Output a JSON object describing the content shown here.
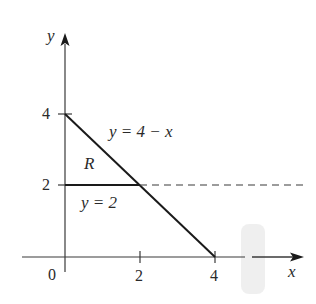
{
  "figure": {
    "title": "",
    "axes": {
      "x_label": "x",
      "y_label": "y",
      "origin_label": "0",
      "x_ticks": [
        {
          "value": 2,
          "label": "2"
        },
        {
          "value": 4,
          "label": "4"
        }
      ],
      "y_ticks": [
        {
          "value": 2,
          "label": "2"
        },
        {
          "value": 4,
          "label": "4"
        }
      ],
      "x_range": [
        0,
        5.3
      ],
      "y_range": [
        0,
        6
      ]
    },
    "curves": [
      {
        "name": "line-y-equals-4-minus-x",
        "equation": "y = 4 − x",
        "from": [
          0,
          4
        ],
        "to": [
          4,
          0
        ],
        "style": "solid"
      },
      {
        "name": "line-y-equals-2-solid",
        "equation": "y = 2",
        "from": [
          0,
          2
        ],
        "to": [
          2,
          2
        ],
        "style": "solid"
      },
      {
        "name": "line-y-equals-2-dashed",
        "equation": "y = 2",
        "from": [
          2,
          2
        ],
        "to": [
          6.3,
          2
        ],
        "style": "dashed"
      }
    ],
    "labels": {
      "curve1": "y = 4 − x",
      "curve2": "y = 2",
      "region": "R"
    },
    "colors": {
      "ink": "#1a1a1a",
      "axis": "#3a3a3a",
      "artifact": "#e6e6e6"
    }
  }
}
